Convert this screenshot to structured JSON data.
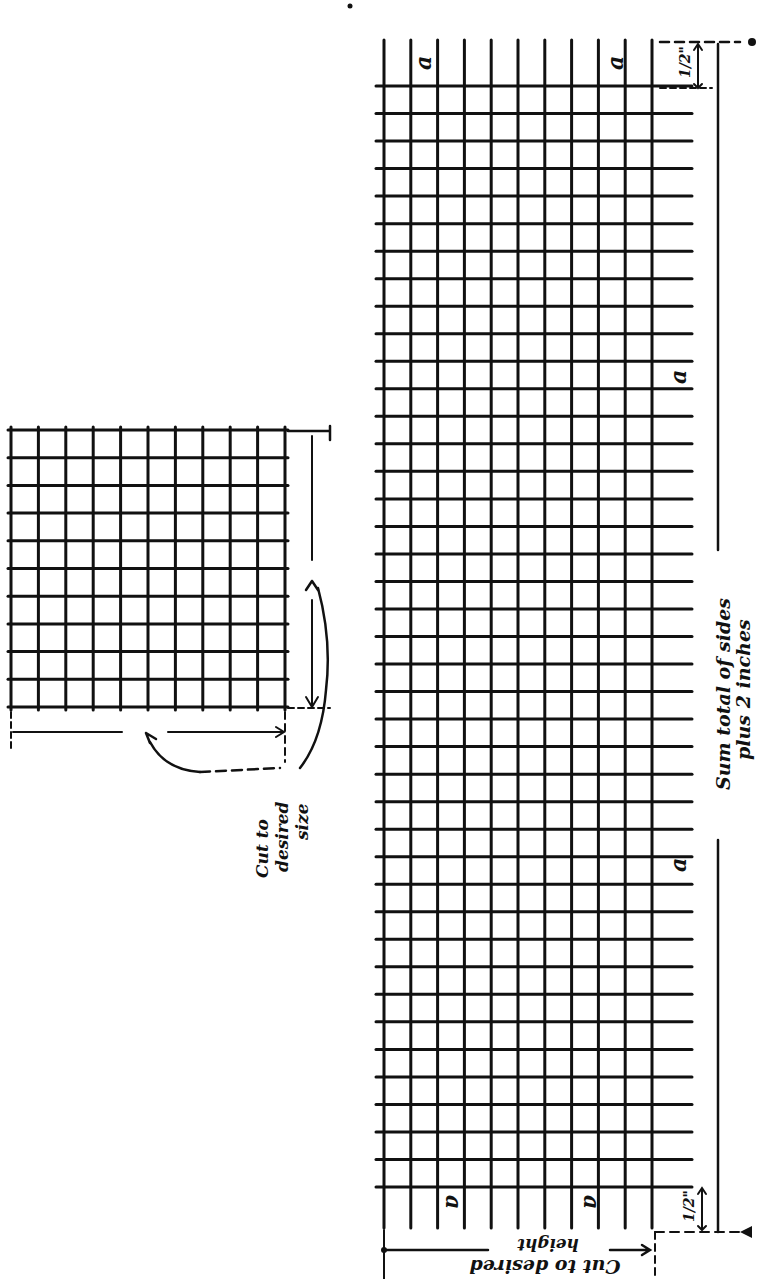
{
  "figure": {
    "ink_color": "#111111",
    "background": "#ffffff"
  },
  "small_grid": {
    "x0": 11,
    "y0": 430,
    "x1": 285,
    "y1": 707,
    "cols": 11,
    "rows": 11,
    "annotation": {
      "line1": "Cut to",
      "line2": "desired",
      "line3": "size"
    }
  },
  "large_grid": {
    "x0": 384,
    "y0": 86,
    "x1": 652,
    "y1": 1187,
    "cols": 11,
    "rows": 41,
    "wire_top": 40,
    "wire_bottom": 1228,
    "wire_right": 692,
    "labels": {
      "a": "a",
      "sum_line1": "Sum total of sides",
      "sum_line2": "plus 2 inches",
      "height_line1": "height",
      "height_line2": "Cut to desired",
      "half_inch_top": "1/2\"",
      "half_inch_bottom": "1/2\""
    }
  }
}
